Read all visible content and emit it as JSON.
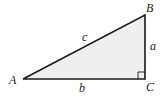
{
  "diagram": {
    "type": "right-triangle",
    "fill_color": "#efefef",
    "stroke_color": "#1a1a1a",
    "vertices": {
      "A": {
        "label": "A",
        "x": 23,
        "y": 79
      },
      "B": {
        "label": "B",
        "x": 145,
        "y": 15
      },
      "C": {
        "label": "C",
        "x": 145,
        "y": 79
      }
    },
    "sides": {
      "a": {
        "label": "a",
        "between": "B-C"
      },
      "b": {
        "label": "b",
        "between": "A-C"
      },
      "c": {
        "label": "c",
        "between": "A-B"
      }
    },
    "right_angle_at": "C"
  }
}
